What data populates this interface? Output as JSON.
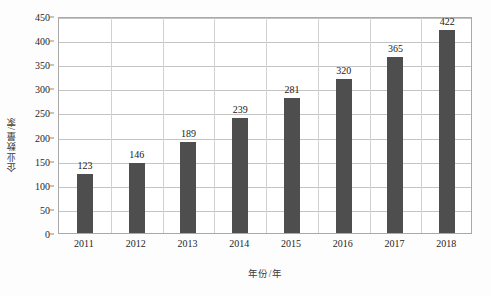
{
  "chart_data": {
    "type": "bar",
    "title": "",
    "xlabel": "年份/年",
    "ylabel": "企业数量/家",
    "categories": [
      "2011",
      "2012",
      "2013",
      "2014",
      "2015",
      "2016",
      "2017",
      "2018"
    ],
    "values": [
      123,
      146,
      189,
      239,
      281,
      320,
      365,
      422
    ],
    "value_labels": [
      "123",
      "146",
      "189",
      "239",
      "281",
      "320",
      "365",
      "422"
    ],
    "ylim": [
      0,
      450
    ],
    "ytick_interval": 50,
    "ytick_labels": [
      "0",
      "50",
      "100",
      "150",
      "200",
      "250",
      "300",
      "350",
      "400",
      "450"
    ],
    "ytick_values": [
      0,
      50,
      100,
      150,
      200,
      250,
      300,
      350,
      400,
      450
    ],
    "grid": {
      "horizontal": true,
      "vertical": true
    },
    "legend": {
      "present": false,
      "position": "none"
    },
    "series": [
      {
        "name": "企业数量",
        "values": [
          123,
          146,
          189,
          239,
          281,
          320,
          365,
          422
        ]
      }
    ],
    "colors": {
      "bar": "#4e4e4e",
      "frame": "#a9a9a9",
      "gridline": "#c4c4c4",
      "vertical_gridline": "#d2d2d2",
      "text": "#1a1a1a",
      "background": "#ffffff",
      "page_background": "#fdfdfd"
    }
  }
}
